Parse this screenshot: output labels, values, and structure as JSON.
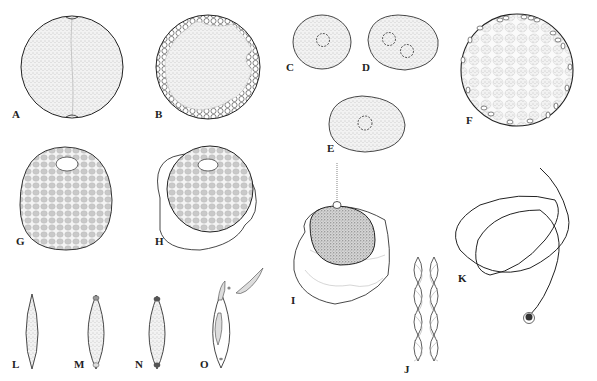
{
  "figure": {
    "type": "scientific-illustration-plate",
    "panels": [
      {
        "id": "A",
        "label": "A",
        "description": "spherical cell, stippled, with median division line"
      },
      {
        "id": "B",
        "label": "B",
        "description": "spherical cell with peripheral clusters of small rounded bodies"
      },
      {
        "id": "C",
        "label": "C",
        "description": "oval stippled cell with one nucleus"
      },
      {
        "id": "D",
        "label": "D",
        "description": "oval stippled cell with two nuclei"
      },
      {
        "id": "E",
        "label": "E",
        "description": "oval stippled cell with one nucleus"
      },
      {
        "id": "F",
        "label": "F",
        "description": "spherical cell with reticulate pattern and peripheral ovoid bodies"
      },
      {
        "id": "G",
        "label": "G",
        "description": "ovoid cell with reticulate granular pattern and apical pore"
      },
      {
        "id": "H",
        "label": "H",
        "description": "cell with granular pattern and apical pore, enclosed by a membrane"
      },
      {
        "id": "I",
        "label": "I",
        "description": "densely stippled cell with apical tube inside a wrinkled sheath"
      },
      {
        "id": "J",
        "label": "J",
        "description": "braided filament segment"
      },
      {
        "id": "K",
        "label": "K",
        "description": "long coiled filament with terminal knob"
      },
      {
        "id": "L",
        "label": "L",
        "description": "fusiform spore, stippled"
      },
      {
        "id": "M",
        "label": "M",
        "description": "fusiform spore with polar caps"
      },
      {
        "id": "N",
        "label": "N",
        "description": "fusiform spore with darker polar caps"
      },
      {
        "id": "O",
        "label": "O",
        "description": "empty spore shell releasing contents"
      }
    ]
  },
  "colors": {
    "background": "#ffffff",
    "ink": "#222222",
    "stipple": "#9a9a9a",
    "dense_stipple": "#6e6e6e"
  }
}
